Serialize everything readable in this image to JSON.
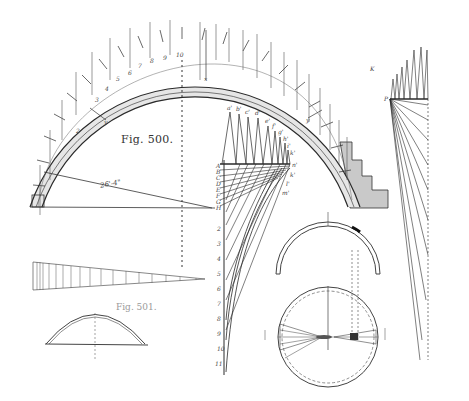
{
  "figure": {
    "main_caption": "Fig. 500.",
    "secondary_caption": "Fig. 501.",
    "dimension_label": "26'-4\""
  },
  "arch_labels": {
    "intrados_numbers": [
      "2",
      "3",
      "4",
      "5",
      "6",
      "7",
      "8",
      "9",
      "10",
      "11",
      "12"
    ],
    "axis_labels": [
      "x",
      "y",
      "y",
      "K"
    ]
  },
  "force_polygon": {
    "top_labels": [
      "a'",
      "b'",
      "c'",
      "d'",
      "e'",
      "f'",
      "g'",
      "h'",
      "i'",
      "k'"
    ],
    "right_labels": [
      "n'",
      "o'",
      "k'",
      "l'",
      "m'",
      "n'",
      "o'"
    ],
    "left_labels": [
      "A",
      "B",
      "C",
      "D",
      "E",
      "F",
      "G",
      "H"
    ],
    "vertical_scale_labels": [
      "H",
      "2",
      "3",
      "4",
      "5",
      "6",
      "7",
      "8",
      "9",
      "10",
      "11",
      "12"
    ]
  },
  "right_fan": {
    "pole_label": "P"
  },
  "colors": {
    "ink": "#2a2a2a",
    "faint_ink": "#8a8a8a",
    "shade": "#c8c8c8",
    "paper": "#ffffff"
  }
}
